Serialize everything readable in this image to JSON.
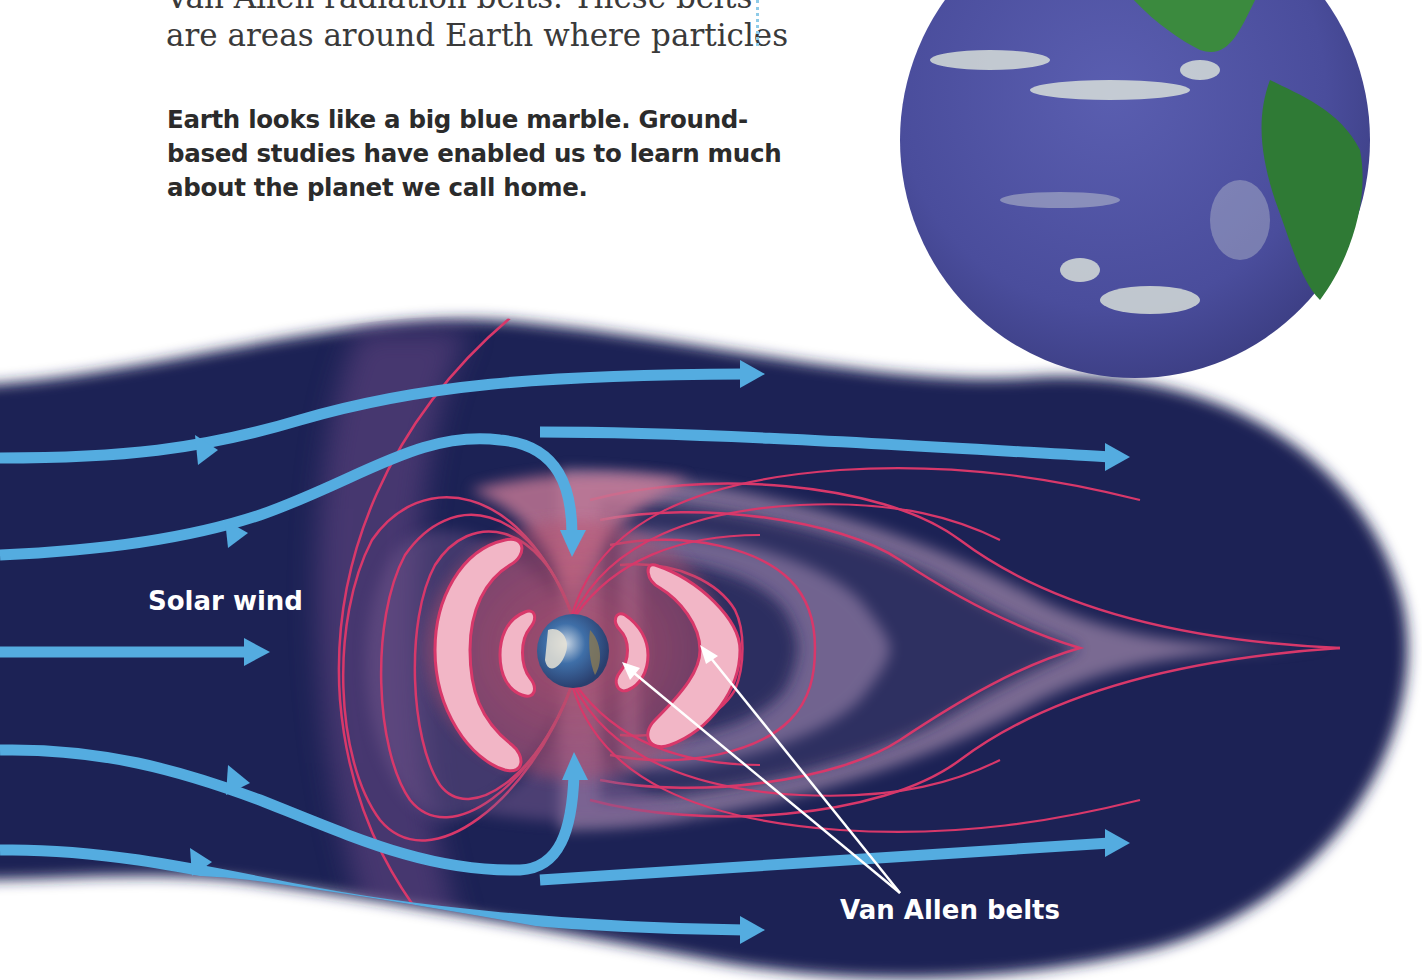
{
  "text": {
    "body_lines": [
      "Van Allen radiation belts. These belts",
      "are areas around Earth where particles"
    ],
    "caption_lines": [
      "Earth looks like a big blue marble. Ground-",
      "based studies have enabled us to learn much",
      "about the planet we call home."
    ]
  },
  "diagram": {
    "labels": {
      "solar_wind": "Solar wind",
      "van_allen_belts": "Van Allen belts"
    },
    "colors": {
      "space": "#1d2155",
      "solar_wind_arrows": "#54ace0",
      "field_lines": "#d8386a",
      "belts": "#f2b6c6",
      "label_text": "#ffffff",
      "pointer_lines": "#ffffff"
    }
  },
  "photo": {
    "subject": "Earth from space (Pacific Ocean and Americas)",
    "colors": {
      "ocean": "#4b4fa0",
      "land": "#2f8a3a",
      "clouds": "#e8f0e0"
    }
  }
}
